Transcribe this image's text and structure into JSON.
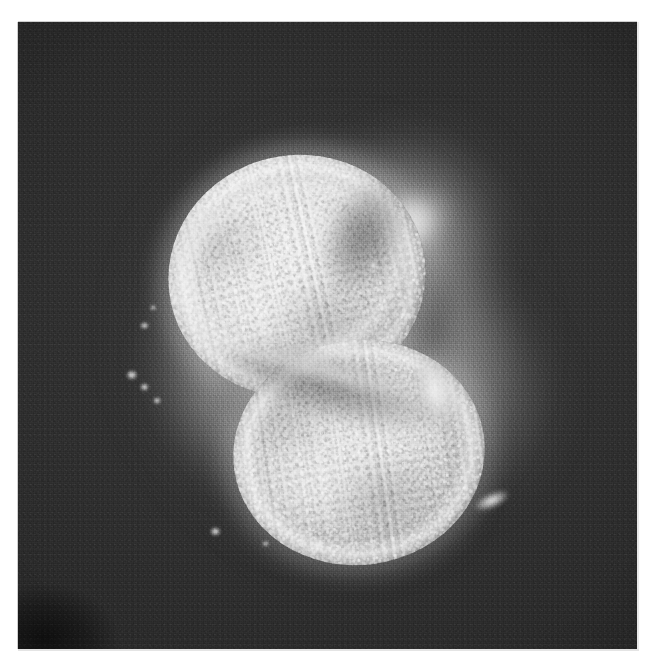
{
  "image": {
    "kind": "micrograph",
    "modality": "phase-contrast light micrograph",
    "subject": "two-cell stage embryo (2 blastomeres)",
    "color_mode": "grayscale",
    "alt_text": "Grayscale phase-contrast micrograph of a two-cell embryo on a dark field; two bright, granular blastomeres fill the centre, surrounded by a diffuse halo with small bright debris specks.",
    "canvas": {
      "width": 658,
      "height": 671,
      "background": "#ffffff"
    },
    "plate": {
      "left": 18,
      "top": 22,
      "width": 619,
      "height": 627,
      "background": "#2b2b2b",
      "border_color": "#cfcfcf"
    }
  },
  "palette": {
    "page_background": "#ffffff",
    "field_dark": "#2b2b2b",
    "field_dark_edge": "#262626",
    "field_mid": "#3a3a3a",
    "halo_gray": "#969696",
    "cell_bright": "#ececec",
    "cell_mid": "#d8d8d8",
    "cell_edge": "#8f8f8f",
    "speck_white": "#ffffff"
  },
  "features": [
    {
      "id": "cell-upper",
      "label": "upper-left blastomere",
      "center": [
        279,
        254
      ],
      "size": [
        258,
        242
      ],
      "rotation_deg": -12,
      "brightness": "very bright",
      "texture": "coarse granular cytoplasm"
    },
    {
      "id": "cell-lower",
      "label": "lower-right blastomere",
      "center": [
        341,
        430
      ],
      "size": [
        252,
        225
      ],
      "rotation_deg": -8,
      "brightness": "bright",
      "texture": "coarse granular cytoplasm"
    },
    {
      "id": "polar-body",
      "label": "bright fragment / polar body, upper right",
      "center": [
        396,
        205
      ],
      "size": [
        112,
        74
      ],
      "rotation_deg": -26,
      "brightness": "bright, out of focus"
    },
    {
      "id": "fragment-right",
      "label": "bright arc fragment right of cleavage furrow",
      "center": [
        421,
        373
      ],
      "size": [
        46,
        86
      ],
      "rotation_deg": -22,
      "brightness": "bright"
    },
    {
      "id": "streak-lower-right",
      "label": "bright elongated streak, lower right",
      "center": [
        476,
        479
      ],
      "size": [
        42,
        17
      ],
      "rotation_deg": -24,
      "brightness": "very bright"
    },
    {
      "id": "cleavage-furrow",
      "label": "cleavage furrow between the two blastomeres",
      "center": [
        313,
        365
      ],
      "rotation_deg": 16,
      "brightness": "dark line with bright rim"
    },
    {
      "id": "halo",
      "label": "diffuse perivitelline halo surrounding the embryo",
      "center": [
        312,
        315
      ],
      "size": [
        440,
        470
      ],
      "brightness": "dim gray glow"
    },
    {
      "id": "corner-smudge",
      "label": "darker smudge at lower-left corner of the print",
      "center": [
        45,
        630
      ],
      "brightness": "very dark"
    }
  ],
  "specks": [
    {
      "x": 140,
      "y": 322,
      "w": 10,
      "h": 8,
      "label": "debris-speck-left-upper"
    },
    {
      "x": 150,
      "y": 305,
      "w": 7,
      "h": 6,
      "label": "debris-speck-left-upper-2"
    },
    {
      "x": 171,
      "y": 296,
      "w": 9,
      "h": 8,
      "label": "debris-speck-left-arc"
    },
    {
      "x": 186,
      "y": 288,
      "w": 8,
      "h": 7,
      "label": "debris-speck-left-arc-2"
    },
    {
      "x": 126,
      "y": 370,
      "w": 13,
      "h": 11,
      "label": "debris-speck-left-mid"
    },
    {
      "x": 140,
      "y": 383,
      "w": 10,
      "h": 9,
      "label": "debris-speck-left-mid-2"
    },
    {
      "x": 153,
      "y": 397,
      "w": 9,
      "h": 8,
      "label": "debris-speck-left-lower"
    },
    {
      "x": 210,
      "y": 527,
      "w": 12,
      "h": 10,
      "label": "debris-speck-bottom-left"
    },
    {
      "x": 262,
      "y": 541,
      "w": 8,
      "h": 6,
      "label": "debris-speck-bottom-mid"
    },
    {
      "x": 312,
      "y": 540,
      "w": 14,
      "h": 11,
      "label": "debris-speck-bottom"
    },
    {
      "x": 340,
      "y": 532,
      "w": 9,
      "h": 7,
      "label": "debris-speck-bottom-right"
    },
    {
      "x": 232,
      "y": 235,
      "w": 8,
      "h": 7,
      "label": "debris-speck-upper-left-rim"
    },
    {
      "x": 252,
      "y": 214,
      "w": 10,
      "h": 8,
      "label": "debris-speck-upper-rim"
    },
    {
      "x": 286,
      "y": 201,
      "w": 9,
      "h": 7,
      "label": "debris-speck-upper-rim-2"
    },
    {
      "x": 368,
      "y": 263,
      "w": 11,
      "h": 6,
      "label": "debris-speck-mid-right"
    },
    {
      "x": 404,
      "y": 312,
      "w": 9,
      "h": 8,
      "label": "debris-speck-right-rim"
    }
  ],
  "chart_data": null
}
